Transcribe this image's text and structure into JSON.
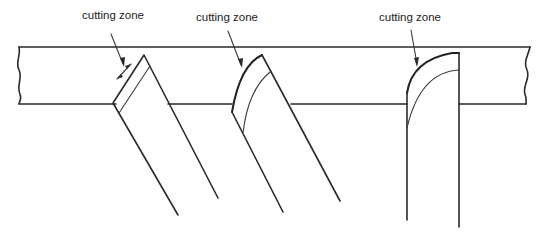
{
  "diagram": {
    "title": "",
    "workpiece": {
      "name": "workpiece-bar"
    },
    "tools": [
      {
        "name": "tool-1",
        "label": "cutting zone",
        "edge_type": "flat chamfered edge with double-arrow zone marker"
      },
      {
        "name": "tool-2",
        "label": "cutting zone",
        "edge_type": "curved edge, inclined tool"
      },
      {
        "name": "tool-3",
        "label": "cutting zone",
        "edge_type": "curved edge, vertical tool"
      }
    ]
  },
  "colors": {
    "line": "#2a2a2a",
    "background": "#ffffff"
  }
}
